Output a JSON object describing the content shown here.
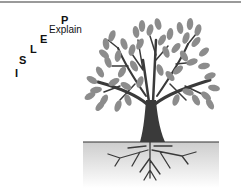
{
  "diagram": {
    "letters": [
      {
        "char": "I",
        "x": 15,
        "y": 68
      },
      {
        "char": "S",
        "x": 19,
        "y": 55
      },
      {
        "char": "L",
        "x": 30,
        "y": 44
      },
      {
        "char": "E",
        "x": 40,
        "y": 34
      },
      {
        "char": "P",
        "x": 61,
        "y": 15
      }
    ],
    "explain_label": {
      "text": "Explain",
      "x": 49,
      "y": 25
    },
    "tree": {
      "leaf_color": "#8c8c8c",
      "trunk_color": "#3a3a3a",
      "ground_line_color": "#333333",
      "soil_gradient_top": "#cfcfcf",
      "soil_gradient_bottom": "#ffffff"
    }
  }
}
